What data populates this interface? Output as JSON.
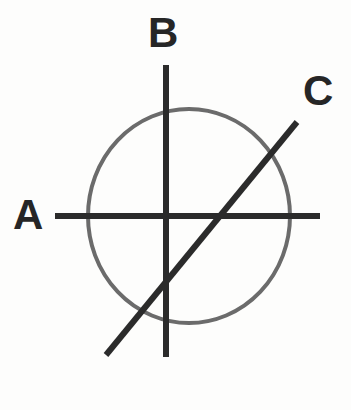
{
  "figure": {
    "background_color": "#fdfdfc",
    "width": 351,
    "height": 410
  },
  "labels": {
    "a": "A",
    "b": "B",
    "c": "C"
  },
  "colors": {
    "line": "#2b2b2b",
    "circle": "#6b6b6b",
    "label": "#262626",
    "background": "#fdfdfc"
  },
  "geometry": {
    "circle": {
      "name": "circle",
      "center_x": 189,
      "center_y": 216,
      "radius_x": 101,
      "radius_y": 107,
      "stroke_width": 4,
      "stroke": "#6b6b6b"
    },
    "lines": [
      {
        "name": "line-a",
        "label": "A",
        "orientation": "horizontal",
        "x1": 55,
        "y1": 216,
        "x2": 320,
        "y2": 216,
        "stroke_width": 6,
        "stroke": "#2b2b2b"
      },
      {
        "name": "line-b",
        "label": "B",
        "orientation": "vertical",
        "x1": 166,
        "y1": 65,
        "x2": 166,
        "y2": 357,
        "stroke_width": 6,
        "stroke": "#2b2b2b"
      },
      {
        "name": "line-c",
        "label": "C",
        "orientation": "diagonal",
        "x1": 106,
        "y1": 355,
        "x2": 297,
        "y2": 122,
        "stroke_width": 6,
        "stroke": "#2b2b2b"
      }
    ]
  }
}
